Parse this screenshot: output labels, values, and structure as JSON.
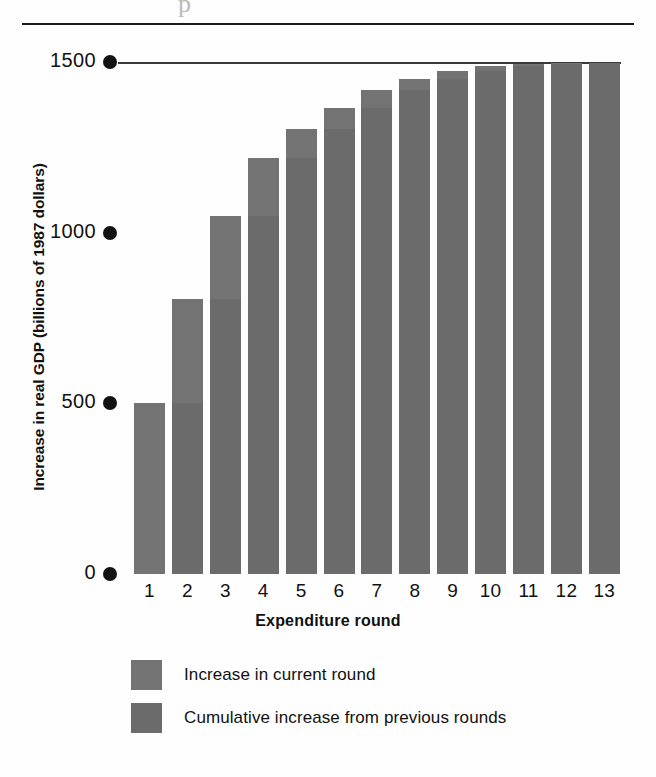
{
  "page": {
    "artifact_glyph": "p",
    "background_color": "#fefefe",
    "rule_color": "#1b1b1b"
  },
  "chart_data": {
    "type": "bar",
    "title": "",
    "subtitle": "",
    "xlabel": "Expenditure round",
    "ylabel": "Increase in real GDP (billions of 1987 dollars)",
    "categories": [
      "1",
      "2",
      "3",
      "4",
      "5",
      "6",
      "7",
      "8",
      "9",
      "10",
      "11",
      "12",
      "13"
    ],
    "values": [
      500,
      805,
      1050,
      1218,
      1304,
      1365,
      1417,
      1450,
      1474,
      1489,
      1494,
      1497,
      1498
    ],
    "series": [
      {
        "name": "Cumulative increase from previous rounds",
        "color": "#6b6b6b",
        "values": [
          0,
          500,
          805,
          1050,
          1218,
          1304,
          1365,
          1417,
          1450,
          1474,
          1489,
          1494,
          1497
        ]
      },
      {
        "name": "Increase in current round",
        "color": "#737373",
        "values": [
          500,
          305,
          245,
          168,
          86,
          61,
          52,
          33,
          24,
          15,
          5,
          3,
          1
        ]
      }
    ],
    "ylim": [
      0,
      1500
    ],
    "yticks": [
      0,
      500,
      1000,
      1500
    ],
    "ytick_labels": [
      "0",
      "500",
      "1000",
      "1500"
    ],
    "grid": false,
    "ceiling_line_value": 1500,
    "legend_position": "bottom-center",
    "bar_color": "#6e6e6e"
  },
  "legend": {
    "items": [
      {
        "label": "Increase in current round",
        "color": "#737373"
      },
      {
        "label": "Cumulative increase from previous rounds",
        "color": "#6b6b6b"
      }
    ]
  },
  "axis": {
    "y_title": "Increase in real GDP (billions of 1987 dollars)",
    "x_title": "Expenditure round",
    "y_labels": [
      "1500",
      "1000",
      "500",
      "0"
    ],
    "x_labels": [
      "1",
      "2",
      "3",
      "4",
      "5",
      "6",
      "7",
      "8",
      "9",
      "10",
      "11",
      "12",
      "13"
    ]
  }
}
